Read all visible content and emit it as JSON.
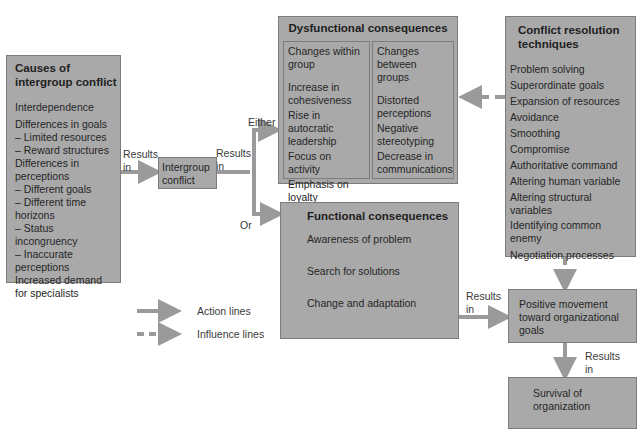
{
  "causes": {
    "title": "Causes of intergroup conflict",
    "items": [
      "Interdependence",
      "Differences in goals",
      "– Limited resources",
      "– Reward structures",
      "Differences in perceptions",
      "– Different goals",
      "– Different time horizons",
      "– Status incongruency",
      "– Inaccurate perceptions",
      "Increased demand for specialists"
    ]
  },
  "intergroup": {
    "label": "Intergroup conflict"
  },
  "dysfunctional": {
    "title": "Dysfunctional consequences",
    "within": {
      "heading": "Changes within group",
      "items": [
        "Increase in cohesiveness",
        "Rise in autocratic leadership",
        "Focus on activity",
        "Emphasis on loyalty"
      ]
    },
    "between": {
      "heading": "Changes between groups",
      "items": [
        "Distorted perceptions",
        "Negative stereotyping",
        "Decrease in communications"
      ]
    }
  },
  "resolution": {
    "title": "Conflict resolution techniques",
    "items": [
      "Problem solving",
      "Superordinate goals",
      "Expansion of resources",
      "Avoidance",
      "Smoothing",
      "Compromise",
      "Authoritative command",
      "Altering human variable",
      "Altering structural variables",
      "Identifying common enemy",
      "Negotiation processes"
    ]
  },
  "functional": {
    "title": "Functional consequences",
    "items": [
      "Awareness of problem",
      "Search for solutions",
      "Change and adaptation"
    ]
  },
  "positive": {
    "label": "Positive movement toward organizational goals"
  },
  "survival": {
    "label": "Survival of organization"
  },
  "labels": {
    "results_in": "Results in",
    "either": "Either",
    "or": "Or"
  },
  "legend": {
    "action": "Action lines",
    "influence": "Influence lines"
  },
  "colors": {
    "box_fill": "#a9a9a9",
    "arrow": "#9a9a9a"
  }
}
